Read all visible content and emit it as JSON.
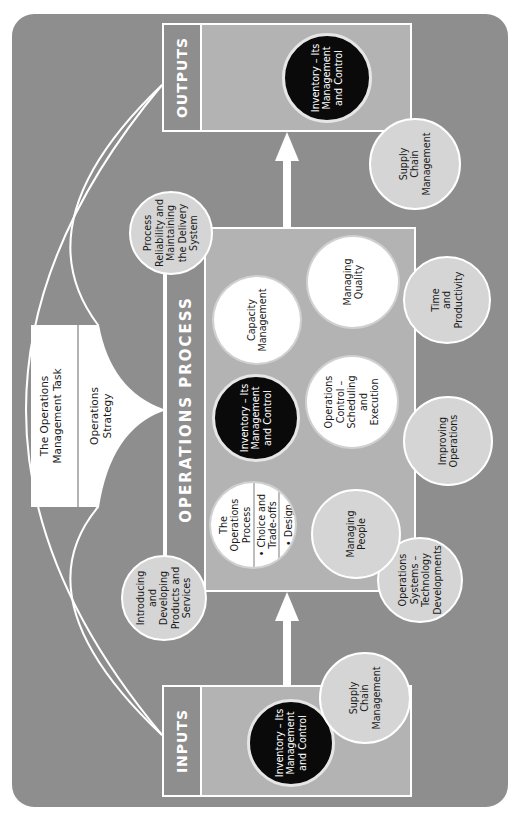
{
  "colors": {
    "panel": "#8e8e8e",
    "box_fill": "#b3b3b3",
    "light_circle": "#d5d5d5",
    "white_circle": "#ffffff",
    "dark_circle": "#0a0a0a",
    "line": "#ffffff"
  },
  "task": {
    "title": "The Operations\nManagement Task",
    "strategy": "Operations\nStrategy"
  },
  "outputs": {
    "label": "OUTPUTS",
    "inventory": "Inventory – Its\nManagement\nand Control",
    "supply_chain": "Supply\nChain\nManagement"
  },
  "inputs": {
    "label": "INPUTS",
    "inventory": "Inventory – Its\nManagement\nand Control",
    "supply_chain": "Supply\nChain\nManagement"
  },
  "process": {
    "label": "OPERATIONS PROCESS",
    "ops_process": {
      "title": "The\nOperations\nProcess",
      "bullet1": "• Choice and\nTrade-offs",
      "bullet2": "• Design"
    },
    "inventory": "Inventory – Its\nManagement\nand Control",
    "capacity": "Capacity\nManagement",
    "managing_people": "Managing\nPeople",
    "ops_control": "Operations\nControl –\nScheduling\nand\nExecution",
    "managing_quality": "Managing\nQuality"
  },
  "surrounding": {
    "introducing": "Introducing\nand Developing\nProducts and\nServices",
    "process_reliability": "Process\nReliability and\nMaintaining\nthe Delivery\nSystem",
    "ops_systems": "Operations\nSystems –\nTechnology\nDevelopments",
    "improving": "Improving\nOperations",
    "time_productivity": "Time\nand\nProductivity"
  }
}
